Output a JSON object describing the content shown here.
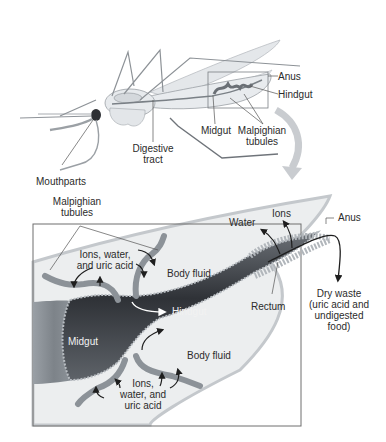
{
  "figure": {
    "colors": {
      "background": "#ffffff",
      "insect_body": "#e9ecef",
      "insect_outline": "#8f9296",
      "gut_dark": "#3c3f44",
      "tubule": "#9aa0a6",
      "body_fluid": "#eceeef",
      "box_border": "#6e6e6e",
      "label_text": "#2b2b2b",
      "arrow": "#1e1e1e",
      "big_arrow": "#c9ccd0"
    }
  },
  "top_panel": {
    "labels": {
      "anus": "Anus",
      "hindgut": "Hindgut",
      "midgut": "Midgut",
      "malpighian_line1": "Malpighian",
      "malpighian_line2": "tubules",
      "digestive_line1": "Digestive",
      "digestive_line2": "tract",
      "mouthparts": "Mouthparts"
    }
  },
  "detail_panel": {
    "labels": {
      "malpighian_line1": "Malpighian",
      "malpighian_line2": "tubules",
      "ions_water_uric_top_line1": "Ions, water,",
      "ions_water_uric_top_line2": "and uric acid",
      "body_fluid_top": "Body fluid",
      "water": "Water",
      "ions": "Ions",
      "anus": "Anus",
      "hindgut": "Hindgut",
      "rectum": "Rectum",
      "midgut": "Midgut",
      "body_fluid_bottom": "Body fluid",
      "dry_waste_line1": "Dry waste",
      "dry_waste_line2": "(uric acid and",
      "dry_waste_line3": "undigested",
      "dry_waste_line4": "food)",
      "ions_water_uric_bottom_line1": "Ions,",
      "ions_water_uric_bottom_line2": "water, and",
      "ions_water_uric_bottom_line3": "uric acid"
    }
  }
}
